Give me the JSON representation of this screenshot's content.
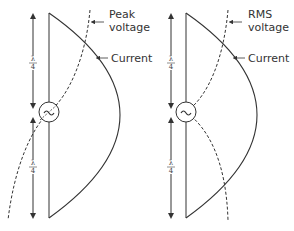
{
  "diagram": {
    "left_panel": {
      "voltage_label_line1": "Peak",
      "voltage_label_line2": "voltage",
      "current_label": "Current",
      "upper_length_num": "λ",
      "upper_length_den": "4",
      "lower_length_num": "λ",
      "lower_length_den": "4",
      "source_symbol": "~"
    },
    "right_panel": {
      "voltage_label_line1": "RMS",
      "voltage_label_line2": "voltage",
      "current_label": "Current",
      "upper_length_num": "λ",
      "upper_length_den": "4",
      "lower_length_num": "λ",
      "lower_length_den": "4",
      "source_symbol": "~"
    },
    "colors": {
      "line": "#333333",
      "background": "#ffffff"
    }
  }
}
